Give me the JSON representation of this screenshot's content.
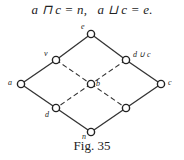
{
  "equation": {
    "left": "a ⊓ c = n,",
    "right": "a ⊔ c = e."
  },
  "figure": {
    "caption": "Fig. 35",
    "nodes": [
      {
        "id": "e",
        "label": "e",
        "x": 91,
        "y": 34
      },
      {
        "id": "v",
        "label": "v",
        "x": 56,
        "y": 60
      },
      {
        "id": "duc",
        "label": "d ∪ c",
        "x": 126,
        "y": 60
      },
      {
        "id": "a",
        "label": "a",
        "x": 21,
        "y": 84
      },
      {
        "id": "b",
        "label": "b",
        "x": 91,
        "y": 84
      },
      {
        "id": "c",
        "label": "c",
        "x": 161,
        "y": 84
      },
      {
        "id": "d",
        "label": "d",
        "x": 56,
        "y": 108
      },
      {
        "id": "br",
        "label": "",
        "x": 126,
        "y": 108
      },
      {
        "id": "n",
        "label": "n",
        "x": 91,
        "y": 132
      }
    ],
    "solid_edges": [
      [
        "e",
        "v"
      ],
      [
        "v",
        "a"
      ],
      [
        "a",
        "d"
      ],
      [
        "d",
        "n"
      ],
      [
        "n",
        "br"
      ],
      [
        "br",
        "c"
      ],
      [
        "c",
        "duc"
      ],
      [
        "duc",
        "e"
      ]
    ],
    "dashed_edges": [
      [
        "v",
        "b"
      ],
      [
        "b",
        "br"
      ],
      [
        "duc",
        "b"
      ],
      [
        "b",
        "d"
      ]
    ]
  }
}
